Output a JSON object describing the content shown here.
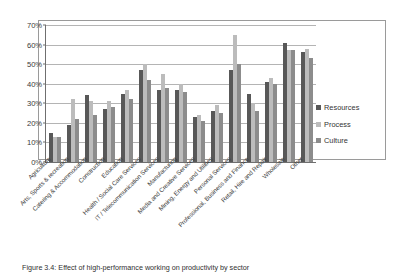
{
  "chart_data": {
    "type": "bar",
    "title": "",
    "xlabel": "",
    "ylabel": "",
    "ylim": [
      0,
      70
    ],
    "ytick_labels": [
      "0%",
      "10%",
      "20%",
      "30%",
      "40%",
      "50%",
      "60%",
      "70%"
    ],
    "ytick_values": [
      0,
      10,
      20,
      30,
      40,
      50,
      60,
      70
    ],
    "grid": true,
    "legend_position": "right",
    "categories": [
      "Agriculture",
      "Arts, Sports & recreation",
      "Catering & Accommodation",
      "Construction",
      "Education",
      "Health / Social Care Services",
      "IT / Telecommunication Services",
      "Manufacturing",
      "Media and Creative Services",
      "Mining, Energy and Utilities",
      "Personal Services",
      "Professional, Business and Finance",
      "Retail, Hire and Repair",
      "Wholesale",
      "Other"
    ],
    "series": [
      {
        "name": "Resources",
        "color": "#585858",
        "values": [
          15,
          19,
          34,
          27,
          35,
          47,
          37,
          37,
          23,
          26,
          47,
          35,
          41,
          61,
          56
        ]
      },
      {
        "name": "Process",
        "color": "#bcbcbc",
        "values": [
          13,
          32,
          31,
          31,
          37,
          50,
          45,
          40,
          24,
          29,
          65,
          30,
          43,
          57,
          58
        ]
      },
      {
        "name": "Culture",
        "color": "#8c8c8c",
        "values": [
          13,
          22,
          24,
          28,
          32,
          42,
          38,
          36,
          21,
          25,
          50,
          26,
          40,
          57,
          53
        ]
      }
    ]
  },
  "legend": {
    "entries": [
      {
        "label": "Resources"
      },
      {
        "label": "Process"
      },
      {
        "label": "Culture"
      }
    ]
  },
  "caption": {
    "text": "Figure 3.4: Effect of high-performance working on productivity by sector"
  }
}
